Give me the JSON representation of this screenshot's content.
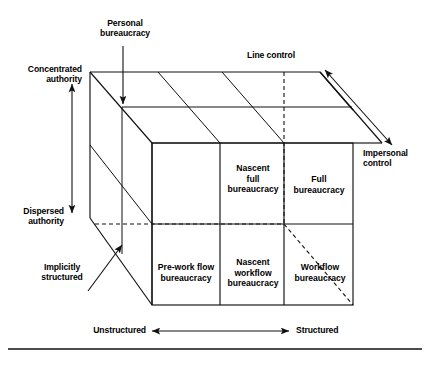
{
  "figure": {
    "type": "three-dimensional-cube-typology",
    "axes": {
      "vertical": {
        "top_label": "Concentrated\nauthority",
        "bottom_label": "Dispersed\nauthority"
      },
      "horizontal": {
        "left_label": "Unstructured",
        "right_label": "Structured"
      },
      "depth": {
        "near_label": "Line control",
        "far_label": "Impersonal\ncontrol"
      }
    },
    "callouts": [
      {
        "name": "personal-bureaucracy",
        "label": "Personal\nbureaucracy"
      },
      {
        "name": "implicitly-structured",
        "label": "Implicitly\nstructured"
      }
    ],
    "cells": [
      {
        "name": "nascent-full-bureaucracy",
        "label": "Nascent\nfull\nbureaucracy",
        "row": "top",
        "col": "middle"
      },
      {
        "name": "full-bureaucracy",
        "label": "Full\nbureaucracy",
        "row": "top",
        "col": "right"
      },
      {
        "name": "pre-work-flow-bureaucracy",
        "label": "Pre-work flow\nbureaucracy",
        "row": "bottom",
        "col": "left"
      },
      {
        "name": "nascent-workflow-bureaucracy",
        "label": "Nascent\nworkflow\nbureaucracy",
        "row": "bottom",
        "col": "middle"
      },
      {
        "name": "workflow-bureaucracy",
        "label": "Workflow\nbureaucracy",
        "row": "bottom",
        "col": "right"
      }
    ],
    "colors": {
      "ink": "#111111",
      "background": "#ffffff"
    }
  }
}
